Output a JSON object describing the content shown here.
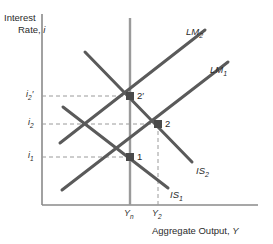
{
  "figure": {
    "domain": "economics-is-lm-diagram",
    "background": "#ffffff",
    "ink": "#5a5a5a",
    "ink_dark": "#2b2b2b",
    "axis_color": "#8a8a8a",
    "dash_color": "#9a9a9a"
  },
  "axes": {
    "y_title_line1": "Interest",
    "y_title_line2": "Rate,",
    "y_title_symbol": "i",
    "x_title_text": "Aggregate Output,",
    "x_title_symbol": "Y",
    "y_ticks": [
      {
        "id": "i2prime",
        "base": "i",
        "sub": "2",
        "prime": "′",
        "y": 96
      },
      {
        "id": "i2",
        "base": "i",
        "sub": "2",
        "prime": "",
        "y": 124
      },
      {
        "id": "i1",
        "base": "i",
        "sub": "1",
        "prime": "",
        "y": 157
      }
    ],
    "x_ticks": [
      {
        "id": "Yn",
        "base": "Y",
        "sub": "n",
        "x": 130
      },
      {
        "id": "Y2",
        "base": "Y",
        "sub": "2",
        "x": 158
      }
    ]
  },
  "curves": [
    {
      "id": "LM2",
      "base": "LM",
      "sub": "2",
      "label_x": 186,
      "label_y": 27
    },
    {
      "id": "LM1",
      "base": "LM",
      "sub": "1",
      "label_x": 210,
      "label_y": 65
    },
    {
      "id": "IS2",
      "base": "IS",
      "sub": "2",
      "label_x": 196,
      "label_y": 166
    },
    {
      "id": "IS1",
      "base": "IS",
      "sub": "1",
      "label_x": 170,
      "label_y": 190
    }
  ],
  "points": [
    {
      "id": "p1",
      "label": "1",
      "x": 130,
      "y": 157,
      "label_x": 137,
      "label_y": 152
    },
    {
      "id": "p2",
      "label": "2",
      "x": 158,
      "y": 124,
      "label_x": 165,
      "label_y": 119
    },
    {
      "id": "p2prime",
      "label": "2′",
      "x": 130,
      "y": 96,
      "label_x": 137,
      "label_y": 91
    }
  ],
  "natural_output_line": {
    "id": "Yn-vertical",
    "x": 130,
    "y_top": 18,
    "y_bottom": 205
  }
}
